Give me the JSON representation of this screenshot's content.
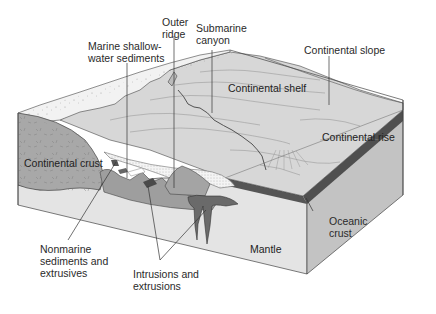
{
  "figure": {
    "type": "block-diagram"
  },
  "labels": {
    "outer_ridge": "Outer\nridge",
    "submarine_canyon": "Submarine\ncanyon",
    "marine_shallow": "Marine shallow-\nwater sediments",
    "continental_slope": "Continental slope",
    "continental_shelf": "Continental shelf",
    "continental_rise": "Continental rise",
    "continental_crust": "Continental crust",
    "oceanic_crust": "Oceanic\ncrust",
    "mantle": "Mantle",
    "nonmarine": "Nonmarine\nsediments and\nextrusives",
    "intrusions": "Intrusions and\nextrusions"
  },
  "colors": {
    "background": "#ffffff",
    "sea_floor": "#d9d9d9",
    "coastal_plain": "#eeeeee",
    "continental_crust": "#a9a9a9",
    "mantle_front": "#e3e3e3",
    "mantle_side": "#c4c4c4",
    "oceanic_crust": "#555555",
    "sediment_wedge": "#f2f2f2",
    "intrusion": "#6e6e6e",
    "lines": "#333333"
  }
}
